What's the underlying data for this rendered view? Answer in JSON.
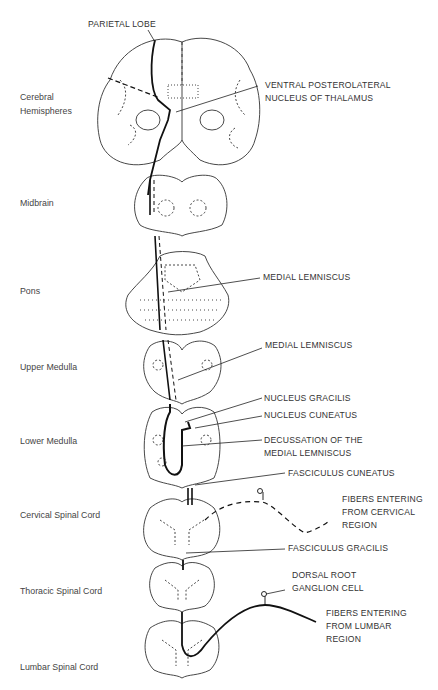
{
  "levels": {
    "cerebral": "Cerebral\nHemispheres",
    "midbrain": "Midbrain",
    "pons": "Pons",
    "upper_medulla": "Upper Medulla",
    "lower_medulla": "Lower Medulla",
    "cervical": "Cervical Spinal Cord",
    "thoracic": "Thoracic Spinal Cord",
    "lumbar": "Lumbar Spinal Cord"
  },
  "labels": {
    "parietal_lobe": "PARIETAL LOBE",
    "vpl": "VENTRAL POSTEROLATERAL\nNUCLEUS OF THALAMUS",
    "medial_lemniscus_pons": "MEDIAL LEMNISCUS",
    "medial_lemniscus_medulla": "MEDIAL LEMNISCUS",
    "nucleus_gracilis": "NUCLEUS GRACILIS",
    "nucleus_cuneatus": "NUCLEUS CUNEATUS",
    "decussation": "DECUSSATION OF THE\nMEDIAL LEMNISCUS",
    "fasciculus_cuneatus": "FASCICULUS CUNEATUS",
    "fibers_cervical": "FIBERS ENTERING\nFROM CERVICAL\nREGION",
    "fasciculus_gracilis": "FASCICULUS GRACILIS",
    "dorsal_root": "DORSAL ROOT\nGANGLION CELL",
    "fibers_lumbar": "FIBERS ENTERING\nFROM LUMBAR\nREGION"
  }
}
